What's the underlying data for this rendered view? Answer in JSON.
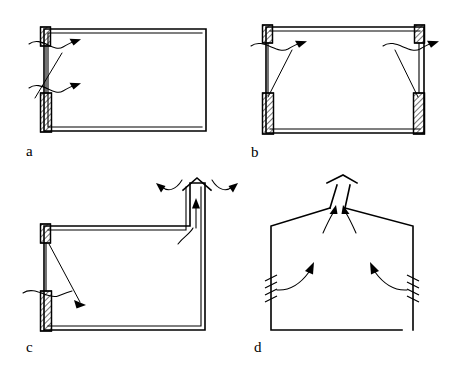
{
  "figure": {
    "background_color": "#ffffff",
    "line_color": "#000000",
    "width": 459,
    "height": 369
  },
  "panels": [
    {
      "id": "a",
      "label": "a",
      "description": "Single-sided ventilation: inlet and outlet openings on one wall",
      "openings": [
        {
          "name": "upper-opening",
          "type": "hatched-block",
          "position": "top-left-eave"
        },
        {
          "name": "lower-opening",
          "type": "hatched-block",
          "position": "left-wall-low"
        }
      ],
      "arrows": [
        {
          "name": "upper-inflow-arrow",
          "direction": "inward-right"
        },
        {
          "name": "lower-inflow-arrow",
          "direction": "inward-right"
        }
      ]
    },
    {
      "id": "b",
      "label": "b",
      "description": "Cross ventilation: paired openings on opposite walls",
      "openings": [
        {
          "name": "upper-left-opening",
          "type": "hatched-block",
          "position": "top-left-eave"
        },
        {
          "name": "lower-left-opening",
          "type": "hatched-block",
          "position": "left-wall-low"
        },
        {
          "name": "upper-right-opening",
          "type": "hatched-block",
          "position": "top-right-eave"
        },
        {
          "name": "lower-right-opening",
          "type": "hatched-block",
          "position": "right-wall-low"
        }
      ],
      "arrows": [
        {
          "name": "left-inflow-arrow",
          "direction": "inward-right"
        },
        {
          "name": "right-outflow-arrow",
          "direction": "outward-right"
        }
      ]
    },
    {
      "id": "c",
      "label": "c",
      "description": "Stack ventilation: vertical chimney shaft with capped outlet",
      "openings": [
        {
          "name": "upper-left-opening",
          "type": "hatched-block",
          "position": "top-left-eave"
        },
        {
          "name": "lower-left-opening",
          "type": "hatched-block",
          "position": "left-wall-low"
        },
        {
          "name": "stack-outlet",
          "type": "capped-chimney",
          "position": "roof-stack"
        }
      ],
      "arrows": [
        {
          "name": "stack-updraft-arrow",
          "direction": "upward"
        },
        {
          "name": "stack-wind-left-arrow",
          "direction": "inward-left"
        },
        {
          "name": "stack-wind-right-arrow",
          "direction": "outward-right"
        },
        {
          "name": "interior-rise-arrow",
          "direction": "upward-curved"
        },
        {
          "name": "low-inflow-arrow",
          "direction": "inward-right"
        }
      ]
    },
    {
      "id": "d",
      "label": "d",
      "description": "Ridge ventilation: pitched roof with capped ridge vent and louvred side walls",
      "openings": [
        {
          "name": "left-louvre",
          "type": "louvre-slots",
          "position": "left-wall"
        },
        {
          "name": "right-louvre",
          "type": "louvre-slots",
          "position": "right-wall"
        },
        {
          "name": "ridge-vent",
          "type": "capped-ridge",
          "position": "roof-ridge"
        }
      ],
      "arrows": [
        {
          "name": "left-inflow-arrow",
          "direction": "inward-up-right"
        },
        {
          "name": "right-inflow-arrow",
          "direction": "inward-up-left"
        },
        {
          "name": "ridge-outflow-left-arrow",
          "direction": "upward-right"
        },
        {
          "name": "ridge-outflow-right-arrow",
          "direction": "upward-left"
        }
      ]
    }
  ]
}
